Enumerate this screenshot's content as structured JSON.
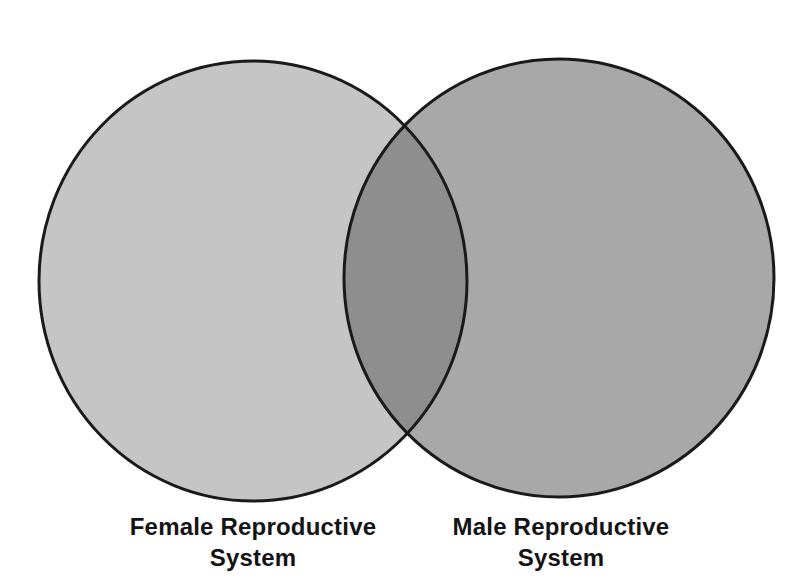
{
  "diagram": {
    "type": "venn",
    "title": "",
    "sets": [
      {
        "id": "female",
        "label": "Female Reproductive\nSystem",
        "fill": "#c5c5c5"
      },
      {
        "id": "male",
        "label": "Male Reproductive\nSystem",
        "fill": "#a8a8a8"
      }
    ],
    "overlap": {
      "fill": "#8e8e8e",
      "items": []
    },
    "outline_color": "#1a1a1a",
    "background_color": "#ffffff",
    "text_color": "#141414"
  }
}
